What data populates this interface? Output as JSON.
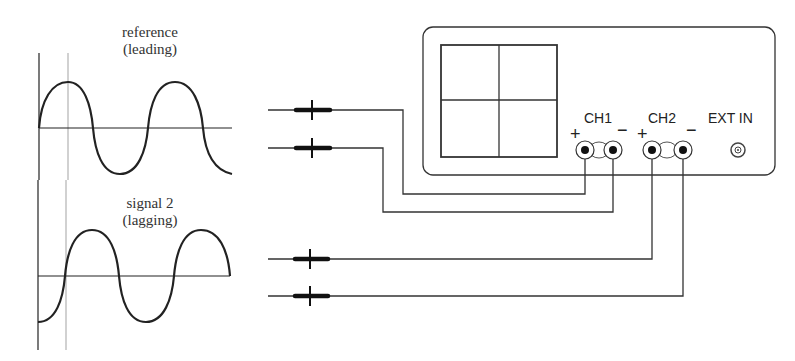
{
  "waveforms": {
    "reference": {
      "line1": "reference",
      "line2": "(leading)"
    },
    "signal2": {
      "line1": "signal 2",
      "line2": "(lagging)"
    }
  },
  "oscilloscope": {
    "channels": [
      {
        "label": "CH1",
        "plus": "+",
        "minus": "−"
      },
      {
        "label": "CH2",
        "plus": "+",
        "minus": "−"
      }
    ],
    "ext_in": "EXT IN"
  },
  "colors": {
    "line": "#222222",
    "faint": "#999999"
  }
}
